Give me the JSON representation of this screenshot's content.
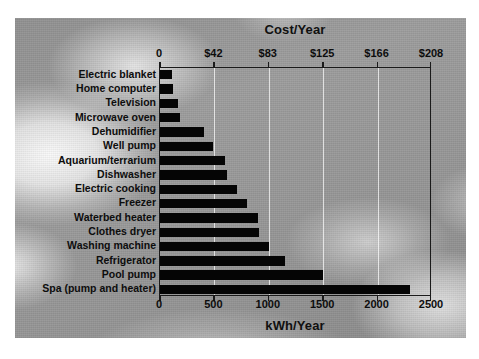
{
  "figure": {
    "background_color": "#9d9d9d",
    "bar_color": "#050505",
    "frame_color": "#1a1a1a",
    "gridline_color": "#ffffff"
  },
  "chart_data": {
    "type": "bar",
    "orientation": "horizontal",
    "title": "",
    "xlabel": "kWh/Year",
    "top_axis_label": "Cost/Year",
    "ylabel": "",
    "xlim": [
      0,
      2500
    ],
    "grid": true,
    "legend": null,
    "categories": [
      "Electric blanket",
      "Home computer",
      "Television",
      "Microwave oven",
      "Dehumidifier",
      "Well pump",
      "Aquarium/terrarium",
      "Dishwasher",
      "Electric cooking",
      "Freezer",
      "Waterbed heater",
      "Clothes dryer",
      "Washing machine",
      "Refrigerator",
      "Pool pump",
      "Spa (pump and heater)"
    ],
    "values": [
      110,
      115,
      165,
      185,
      400,
      490,
      600,
      620,
      710,
      800,
      900,
      910,
      1000,
      1150,
      1500,
      2300
    ],
    "value_unit": "kWh/Year",
    "bottom_ticks": [
      {
        "value": 0,
        "label": "0"
      },
      {
        "value": 500,
        "label": "500"
      },
      {
        "value": 1000,
        "label": "1000"
      },
      {
        "value": 1500,
        "label": "1500"
      },
      {
        "value": 2000,
        "label": "2000"
      },
      {
        "value": 2500,
        "label": "2500"
      }
    ],
    "top_ticks": [
      {
        "value": 0,
        "label": "0"
      },
      {
        "value": 500,
        "label": "$42"
      },
      {
        "value": 1000,
        "label": "$83"
      },
      {
        "value": 1500,
        "label": "$125"
      },
      {
        "value": 2000,
        "label": "$166"
      },
      {
        "value": 2500,
        "label": "$208"
      }
    ]
  }
}
